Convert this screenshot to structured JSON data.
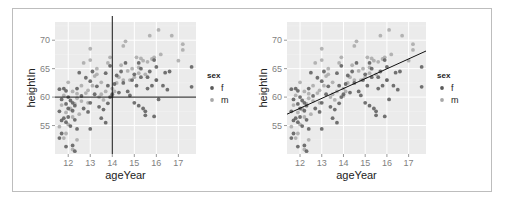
{
  "chart_data": [
    {
      "type": "scatter",
      "panel": "left",
      "xlabel": "ageYear",
      "ylabel": "heightIn",
      "x_ticks": [
        12,
        13,
        14,
        15,
        16,
        17
      ],
      "y_ticks": [
        55,
        60,
        65,
        70
      ],
      "xlim": [
        11.4,
        17.8
      ],
      "ylim": [
        50.0,
        73.2
      ],
      "grid": true,
      "legend": {
        "title": "sex",
        "position": "right",
        "entries": [
          {
            "label": "f",
            "color": "#5a5a5a"
          },
          {
            "label": "m",
            "color": "#a8a8a8"
          }
        ]
      },
      "reference_lines": [
        {
          "type": "vline",
          "x": 14
        },
        {
          "type": "hline",
          "y": 60
        }
      ]
    },
    {
      "type": "scatter",
      "panel": "right",
      "xlabel": "ageYear",
      "ylabel": "heightIn",
      "x_ticks": [
        12,
        13,
        14,
        15,
        16,
        17
      ],
      "y_ticks": [
        55,
        60,
        65,
        70
      ],
      "xlim": [
        11.4,
        17.8
      ],
      "ylim": [
        50.0,
        73.2
      ],
      "grid": true,
      "legend": {
        "title": "sex",
        "position": "right",
        "entries": [
          {
            "label": "f",
            "color": "#5a5a5a"
          },
          {
            "label": "m",
            "color": "#a8a8a8"
          }
        ]
      },
      "reference_lines": [
        {
          "type": "abline",
          "x0": 11.4,
          "y0": 57.0,
          "x1": 17.8,
          "y1": 68.1
        }
      ]
    }
  ],
  "points": {
    "f": [
      [
        11.6,
        52.8
      ],
      [
        11.7,
        53.6
      ],
      [
        11.9,
        51.3
      ],
      [
        12.2,
        51.5
      ],
      [
        12.3,
        50.5
      ],
      [
        11.6,
        57.5
      ],
      [
        11.7,
        55.9
      ],
      [
        11.8,
        56.3
      ],
      [
        11.9,
        55.6
      ],
      [
        12.0,
        56.5
      ],
      [
        12.1,
        54.9
      ],
      [
        12.2,
        57.6
      ],
      [
        12.3,
        56.0
      ],
      [
        12.4,
        54.4
      ],
      [
        11.6,
        61.4
      ],
      [
        11.8,
        61.5
      ],
      [
        11.9,
        61.1
      ],
      [
        12.0,
        60.0
      ],
      [
        12.1,
        59.4
      ],
      [
        12.2,
        59.0
      ],
      [
        12.3,
        58.5
      ],
      [
        12.0,
        58.0
      ],
      [
        11.7,
        59.6
      ],
      [
        11.9,
        58.8
      ],
      [
        12.4,
        61.5
      ],
      [
        12.5,
        64.3
      ],
      [
        12.6,
        60.2
      ],
      [
        12.7,
        58.0
      ],
      [
        12.9,
        57.4
      ],
      [
        13.0,
        54.4
      ],
      [
        13.0,
        59.0
      ],
      [
        13.2,
        60.5
      ],
      [
        13.3,
        61.9
      ],
      [
        13.0,
        62.8
      ],
      [
        13.1,
        64.5
      ],
      [
        12.8,
        63.4
      ],
      [
        13.4,
        58.3
      ],
      [
        13.6,
        57.8
      ],
      [
        13.5,
        56.3
      ],
      [
        13.7,
        55.5
      ],
      [
        13.8,
        58.9
      ],
      [
        13.9,
        60.0
      ],
      [
        13.8,
        62.0
      ],
      [
        13.7,
        64.2
      ],
      [
        13.9,
        65.5
      ],
      [
        14.0,
        60.5
      ],
      [
        14.1,
        62.3
      ],
      [
        14.2,
        63.8
      ],
      [
        14.3,
        60.8
      ],
      [
        14.4,
        64.5
      ],
      [
        14.5,
        62.5
      ],
      [
        14.7,
        61.0
      ],
      [
        14.8,
        60.3
      ],
      [
        14.9,
        63.0
      ],
      [
        15.0,
        64.0
      ],
      [
        15.1,
        62.0
      ],
      [
        15.2,
        58.5
      ],
      [
        15.0,
        59.0
      ],
      [
        15.3,
        65.0
      ],
      [
        15.4,
        58.0
      ],
      [
        15.5,
        57.5
      ],
      [
        15.5,
        56.8
      ],
      [
        15.6,
        61.5
      ],
      [
        15.6,
        63.5
      ],
      [
        15.7,
        64.5
      ],
      [
        15.8,
        62.0
      ],
      [
        15.9,
        56.6
      ],
      [
        15.9,
        66.5
      ],
      [
        16.0,
        63.0
      ],
      [
        16.0,
        65.3
      ],
      [
        16.1,
        59.6
      ],
      [
        16.3,
        62.0
      ],
      [
        16.4,
        64.3
      ],
      [
        16.5,
        61.3
      ],
      [
        16.6,
        64.5
      ],
      [
        17.6,
        65.3
      ],
      [
        17.6,
        61.8
      ],
      [
        14.6,
        66.0
      ],
      [
        15.2,
        66.0
      ],
      [
        15.3,
        63.5
      ]
    ],
    "m": [
      [
        11.6,
        54.8
      ],
      [
        11.8,
        52.8
      ],
      [
        11.9,
        53.6
      ],
      [
        12.2,
        50.8
      ],
      [
        12.4,
        52.5
      ],
      [
        11.7,
        58.6
      ],
      [
        11.9,
        57.3
      ],
      [
        12.0,
        55.2
      ],
      [
        12.1,
        57.8
      ],
      [
        12.2,
        56.5
      ],
      [
        12.3,
        58.8
      ],
      [
        12.4,
        59.8
      ],
      [
        12.5,
        57.0
      ],
      [
        12.6,
        59.3
      ],
      [
        11.8,
        60.3
      ],
      [
        12.0,
        62.6
      ],
      [
        12.2,
        61.0
      ],
      [
        12.4,
        60.6
      ],
      [
        12.6,
        62.0
      ],
      [
        12.8,
        60.7
      ],
      [
        12.9,
        61.2
      ],
      [
        12.7,
        66.0
      ],
      [
        13.0,
        66.5
      ],
      [
        13.0,
        68.5
      ],
      [
        13.1,
        62.0
      ],
      [
        13.2,
        63.7
      ],
      [
        13.3,
        65.0
      ],
      [
        13.4,
        60.0
      ],
      [
        13.5,
        62.6
      ],
      [
        13.6,
        59.5
      ],
      [
        13.7,
        61.0
      ],
      [
        13.8,
        66.0
      ],
      [
        13.9,
        67.0
      ],
      [
        14.0,
        61.5
      ],
      [
        14.1,
        61.0
      ],
      [
        14.2,
        62.5
      ],
      [
        14.3,
        63.5
      ],
      [
        14.4,
        65.6
      ],
      [
        14.5,
        69.0
      ],
      [
        14.6,
        69.8
      ],
      [
        14.7,
        64.6
      ],
      [
        14.8,
        63.0
      ],
      [
        14.9,
        65.0
      ],
      [
        15.0,
        63.5
      ],
      [
        15.1,
        67.0
      ],
      [
        15.2,
        65.2
      ],
      [
        15.3,
        66.8
      ],
      [
        15.4,
        66.4
      ],
      [
        15.5,
        64.0
      ],
      [
        15.6,
        66.2
      ],
      [
        15.7,
        70.8
      ],
      [
        15.8,
        66.7
      ],
      [
        15.9,
        67.0
      ],
      [
        16.0,
        63.0
      ],
      [
        16.1,
        71.8
      ],
      [
        16.2,
        67.5
      ],
      [
        16.7,
        70.8
      ],
      [
        17.0,
        66.4
      ],
      [
        17.2,
        69.3
      ],
      [
        17.2,
        68.3
      ],
      [
        14.0,
        60.2
      ],
      [
        13.5,
        60.5
      ],
      [
        12.9,
        59.0
      ],
      [
        14.5,
        63.0
      ],
      [
        15.2,
        64.2
      ],
      [
        13.3,
        64.0
      ],
      [
        12.1,
        58.0
      ]
    ]
  },
  "colors": {
    "panel_bg": "#ebebeb",
    "grid": "#ffffff",
    "f": "#5a5a5a",
    "m": "#a8a8a8",
    "ref_line": "#111111",
    "frame": "#bdbdbd"
  }
}
